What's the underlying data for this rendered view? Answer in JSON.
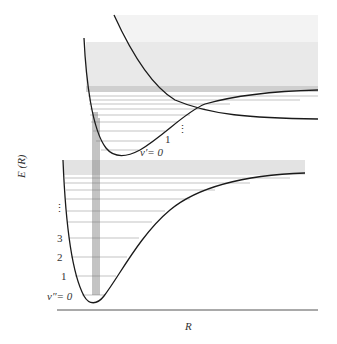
{
  "figure": {
    "title": "",
    "axes": {
      "ylabel": "E (R)",
      "xlabel": "R"
    },
    "upper_state": {
      "level_labels": [
        "v′= 0",
        "1"
      ],
      "ellipsis": "⋮"
    },
    "lower_state": {
      "level_labels": [
        "v″= 0",
        "1",
        "2",
        "3"
      ],
      "ellipsis": "⋮"
    },
    "colors": {
      "curve": "#1a1a1a",
      "shading": "#e6e6e6",
      "level_lines": "#9a9a9a",
      "text": "#333333"
    }
  }
}
